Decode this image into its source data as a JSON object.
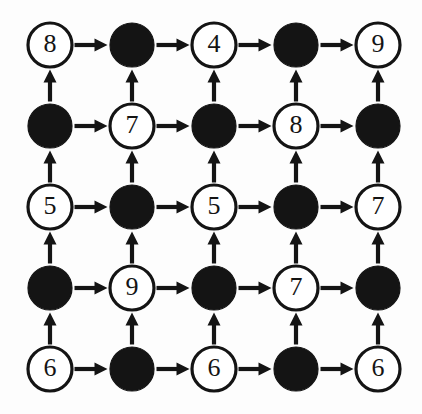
{
  "figure": {
    "type": "diagram",
    "background_color": "#fdfdfd",
    "ink_color": "#141414",
    "rows": 5,
    "cols": 5,
    "geometry": {
      "origin_x": 50,
      "origin_y": 45,
      "spacing_x": 82,
      "spacing_y": 81,
      "node_radius": 22,
      "label_font_size": 26,
      "edge_stroke_width": 4.2,
      "node_stroke_width": 3.2
    },
    "node_styles": {
      "open": "white circle with black outline and a digit label",
      "filled": "solid black circle with no label"
    },
    "edge_rules": {
      "horizontal": "arrow points right, from each node to its right neighbour",
      "vertical": "arrow points up, from each node to the node above it"
    },
    "nodes": [
      [
        {
          "style": "open",
          "label": "8"
        },
        {
          "style": "filled",
          "label": ""
        },
        {
          "style": "open",
          "label": "4"
        },
        {
          "style": "filled",
          "label": ""
        },
        {
          "style": "open",
          "label": "9"
        }
      ],
      [
        {
          "style": "filled",
          "label": ""
        },
        {
          "style": "open",
          "label": "7"
        },
        {
          "style": "filled",
          "label": ""
        },
        {
          "style": "open",
          "label": "8"
        },
        {
          "style": "filled",
          "label": ""
        }
      ],
      [
        {
          "style": "open",
          "label": "5"
        },
        {
          "style": "filled",
          "label": ""
        },
        {
          "style": "open",
          "label": "5"
        },
        {
          "style": "filled",
          "label": ""
        },
        {
          "style": "open",
          "label": "7"
        }
      ],
      [
        {
          "style": "filled",
          "label": ""
        },
        {
          "style": "open",
          "label": "9"
        },
        {
          "style": "filled",
          "label": ""
        },
        {
          "style": "open",
          "label": "7"
        },
        {
          "style": "filled",
          "label": ""
        }
      ],
      [
        {
          "style": "open",
          "label": "6"
        },
        {
          "style": "filled",
          "label": ""
        },
        {
          "style": "open",
          "label": "6"
        },
        {
          "style": "filled",
          "label": ""
        },
        {
          "style": "open",
          "label": "6"
        }
      ]
    ]
  }
}
